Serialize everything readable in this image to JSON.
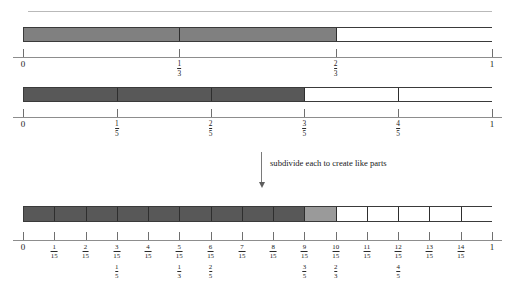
{
  "figure": {
    "caption": "subdivide each to create like parts",
    "colors": {
      "shade_thirds": "#808080",
      "shade_fifths": "#585858",
      "shade_fifteenths_dark": "#585858",
      "shade_fifteenths_light": "#9a9a9a",
      "unshaded": "#ffffff",
      "outline": "#3a3a3a",
      "axis": "#8d8d8d",
      "rule": "#b9b9b9"
    }
  },
  "chart_data": {
    "type": "bar",
    "title": "",
    "xlabel": "",
    "ylabel": "",
    "xlim": [
      0,
      1
    ],
    "grid": false,
    "legend": "none",
    "number_lines": [
      {
        "name": "thirds",
        "denominator": 3,
        "shaded_fraction": "2/3",
        "shaded_value": 0.6667,
        "segments": [
          {
            "from": 0,
            "to": 0.3333,
            "fill": "#808080"
          },
          {
            "from": 0.3333,
            "to": 0.6667,
            "fill": "#808080"
          },
          {
            "from": 0.6667,
            "to": 1,
            "fill": "#ffffff"
          }
        ],
        "ticks": [
          {
            "value": 0,
            "label": "0",
            "type": "int"
          },
          {
            "value": 0.3333,
            "num": "1",
            "den": "3",
            "type": "frac"
          },
          {
            "value": 0.6667,
            "num": "2",
            "den": "3",
            "type": "frac"
          },
          {
            "value": 1,
            "label": "1",
            "type": "int"
          }
        ]
      },
      {
        "name": "fifths",
        "denominator": 5,
        "shaded_fraction": "3/5",
        "shaded_value": 0.6,
        "segments": [
          {
            "from": 0,
            "to": 0.2,
            "fill": "#585858"
          },
          {
            "from": 0.2,
            "to": 0.4,
            "fill": "#585858"
          },
          {
            "from": 0.4,
            "to": 0.6,
            "fill": "#585858"
          },
          {
            "from": 0.6,
            "to": 0.8,
            "fill": "#ffffff"
          },
          {
            "from": 0.8,
            "to": 1,
            "fill": "#ffffff"
          }
        ],
        "ticks": [
          {
            "value": 0,
            "label": "0",
            "type": "int"
          },
          {
            "value": 0.2,
            "num": "1",
            "den": "5",
            "type": "frac"
          },
          {
            "value": 0.4,
            "num": "2",
            "den": "5",
            "type": "frac"
          },
          {
            "value": 0.6,
            "num": "3",
            "den": "5",
            "type": "frac"
          },
          {
            "value": 0.8,
            "num": "4",
            "den": "5",
            "type": "frac"
          },
          {
            "value": 1,
            "label": "1",
            "type": "int"
          }
        ]
      },
      {
        "name": "fifteenths",
        "denominator": 15,
        "shaded_dark_upto": "9/15",
        "shaded_light_range": "9/15 to 10/15",
        "segments": [
          {
            "from": 0,
            "to": 0.0667,
            "fill": "#585858"
          },
          {
            "from": 0.0667,
            "to": 0.1333,
            "fill": "#585858"
          },
          {
            "from": 0.1333,
            "to": 0.2,
            "fill": "#585858"
          },
          {
            "from": 0.2,
            "to": 0.2667,
            "fill": "#585858"
          },
          {
            "from": 0.2667,
            "to": 0.3333,
            "fill": "#585858"
          },
          {
            "from": 0.3333,
            "to": 0.4,
            "fill": "#585858"
          },
          {
            "from": 0.4,
            "to": 0.4667,
            "fill": "#585858"
          },
          {
            "from": 0.4667,
            "to": 0.5333,
            "fill": "#585858"
          },
          {
            "from": 0.5333,
            "to": 0.6,
            "fill": "#585858"
          },
          {
            "from": 0.6,
            "to": 0.6667,
            "fill": "#9a9a9a"
          },
          {
            "from": 0.6667,
            "to": 0.7333,
            "fill": "#ffffff"
          },
          {
            "from": 0.7333,
            "to": 0.8,
            "fill": "#ffffff"
          },
          {
            "from": 0.8,
            "to": 0.8667,
            "fill": "#ffffff"
          },
          {
            "from": 0.8667,
            "to": 0.9333,
            "fill": "#ffffff"
          },
          {
            "from": 0.9333,
            "to": 1,
            "fill": "#ffffff"
          }
        ],
        "ticks": [
          {
            "value": 0,
            "label": "0",
            "type": "int",
            "alt": null
          },
          {
            "value": 0.0667,
            "num": "1",
            "den": "15",
            "type": "frac",
            "alt": null
          },
          {
            "value": 0.1333,
            "num": "2",
            "den": "15",
            "type": "frac",
            "alt": null
          },
          {
            "value": 0.2,
            "num": "3",
            "den": "15",
            "type": "frac",
            "alt": {
              "num": "1",
              "den": "5"
            }
          },
          {
            "value": 0.2667,
            "num": "4",
            "den": "15",
            "type": "frac",
            "alt": null
          },
          {
            "value": 0.3333,
            "num": "5",
            "den": "15",
            "type": "frac",
            "alt": {
              "num": "1",
              "den": "3"
            }
          },
          {
            "value": 0.4,
            "num": "6",
            "den": "15",
            "type": "frac",
            "alt": {
              "num": "2",
              "den": "5"
            }
          },
          {
            "value": 0.4667,
            "num": "7",
            "den": "15",
            "type": "frac",
            "alt": null
          },
          {
            "value": 0.5333,
            "num": "8",
            "den": "15",
            "type": "frac",
            "alt": null
          },
          {
            "value": 0.6,
            "num": "9",
            "den": "15",
            "type": "frac",
            "alt": {
              "num": "3",
              "den": "5"
            }
          },
          {
            "value": 0.6667,
            "num": "10",
            "den": "15",
            "type": "frac",
            "alt": {
              "num": "2",
              "den": "3"
            }
          },
          {
            "value": 0.7333,
            "num": "11",
            "den": "15",
            "type": "frac",
            "alt": null
          },
          {
            "value": 0.8,
            "num": "12",
            "den": "15",
            "type": "frac",
            "alt": {
              "num": "4",
              "den": "5"
            }
          },
          {
            "value": 0.8667,
            "num": "13",
            "den": "15",
            "type": "frac",
            "alt": null
          },
          {
            "value": 0.9333,
            "num": "14",
            "den": "15",
            "type": "frac",
            "alt": null
          },
          {
            "value": 1,
            "label": "1",
            "type": "int",
            "alt": null
          }
        ]
      }
    ]
  }
}
